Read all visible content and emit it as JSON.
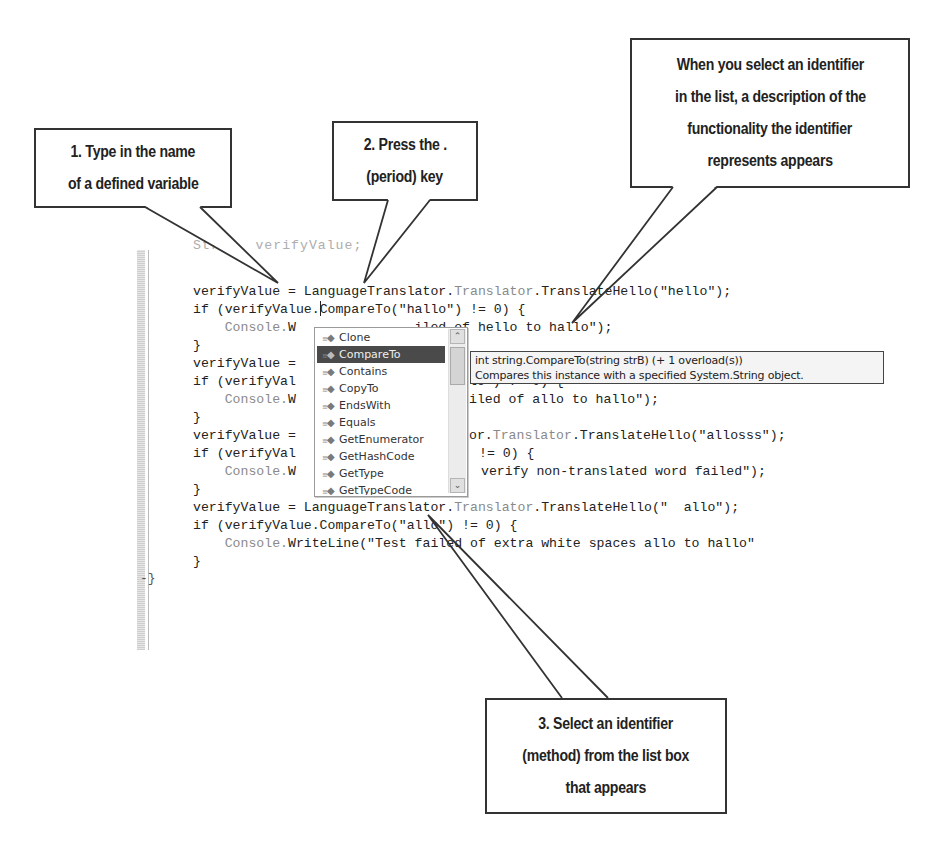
{
  "callouts": {
    "step1": [
      "1. Type in the name",
      "of a defined variable"
    ],
    "step2": [
      "2. Press the .",
      "(period) key"
    ],
    "description": [
      "When you select an identifier",
      "in the list, a description of the",
      "functionality the identifier",
      "represents appears"
    ],
    "step3": [
      "3. Select an identifier",
      "(method) from the list box",
      "that appears"
    ]
  },
  "code": {
    "line0": "Stri   verifyValue;",
    "line1_a": "verifyValue = LanguageTranslator.",
    "line1_b": "Translator",
    "line1_c": ".TranslateHello(\"hello\");",
    "line2_a": "if (verifyValue.",
    "line2_b": "CompareTo(\"hallo\") != 0) {",
    "line3_a": "    Console.",
    "line3_b": "W               iled of hello to hallo\");",
    "line4": "}",
    "line5": "verifyValue =",
    "line6_a": "if (verifyVal",
    "line6_b": "lo\") != 0) {",
    "line7_a": "    Console.W",
    "line7_b": "iled of allo to hallo\");",
    "line8": "}",
    "line9_a": "verifyValue =",
    "line9_b": "or.",
    "line9_c": "Translator",
    "line9_d": ".TranslateHello(\"allosss\");",
    "line10_a": "if (verifyVal",
    "line10_b": "!= 0) {",
    "line11_a": "    Console.W",
    "line11_b": "verify non-translated word failed\");",
    "line12": "}",
    "line13_a": "verifyValue = LanguageTranslator.",
    "line13_b": "Translator",
    "line13_c": ".TranslateHello(\"  allo\");",
    "line14": "if (verifyValue.CompareTo(\"allo\") != 0) {",
    "line15_a": "    Console.",
    "line15_b": "WriteLine(\"Test failed of extra white spaces allo to hallo\"",
    "line16": "}",
    "closing": "-}"
  },
  "intellisense": {
    "items": [
      "Clone",
      "CompareTo",
      "Contains",
      "CopyTo",
      "EndsWith",
      "Equals",
      "GetEnumerator",
      "GetHashCode",
      "GetType",
      "GetTypeCode"
    ],
    "selected_index": 1,
    "item_icon": "method-icon",
    "scroll_up": "⌃",
    "scroll_down": "⌄"
  },
  "tooltip": {
    "signature": "int string.CompareTo(string strB)  (+ 1 overload(s))",
    "description": "Compares this instance with a specified System.String object."
  }
}
